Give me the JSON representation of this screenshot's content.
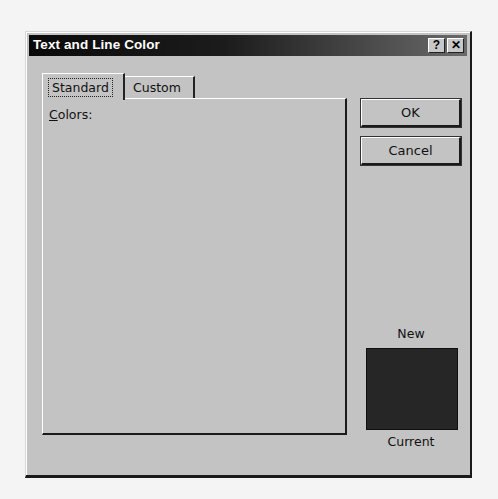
{
  "dialog": {
    "title": "Text and Line Color",
    "help_button": "?",
    "close_button": "✕"
  },
  "tabs": [
    {
      "label": "Standard",
      "active": true
    },
    {
      "label": "Custom",
      "active": false
    }
  ],
  "panel": {
    "colors_label_accel": "C",
    "colors_label_rest": "olors:"
  },
  "buttons": {
    "ok": "OK",
    "cancel": "Cancel"
  },
  "preview": {
    "new_label": "New",
    "current_label": "Current",
    "color": "#262626"
  },
  "hexagon": {
    "selected": {
      "row": 0,
      "col": 0
    },
    "rows": [
      [
        "#2a2a2a",
        "#606060",
        "#6a6a6a",
        "#444444",
        "#3a3a3a",
        "#4a4a4a",
        "#222222"
      ],
      [
        "#505050",
        "#6e6e6e",
        "#7a7a7a",
        "#666666",
        "#4c4c4c",
        "#3e3e3e",
        "#5a5a5a",
        "#383838"
      ],
      [
        "#666666",
        "#7c7c7c",
        "#8c8c8c",
        "#9a9a9a",
        "#7a7a7a",
        "#6a6a6a",
        "#5a5a5a",
        "#4a4a4a",
        "#444444"
      ],
      [
        "#6a6a6a",
        "#848484",
        "#a6a6a6",
        "#b0b0b0",
        "#9c9c9c",
        "#8a8a8a",
        "#7a7a7a",
        "#6c6c6c",
        "#565656",
        "#4e4e4e"
      ],
      [
        "#5c5c5c",
        "#808080",
        "#b8b8b8",
        "#dcdcdc",
        "#d2d2d2",
        "#a8a8a8",
        "#8e8e8e",
        "#808080",
        "#6e6e6e",
        "#585858",
        "#3e3e3e"
      ],
      [
        "#4a4a4a",
        "#7a7a7a",
        "#a6a6a6",
        "#d8d8d8",
        "#e8e8e8",
        "#e0e0e0",
        "#b8b8b8",
        "#9a9a9a",
        "#888888",
        "#747474",
        "#606060",
        "#505050"
      ],
      [
        "#1e1e1e",
        "#6a6a6a",
        "#8c8c8c",
        "#c8c8c8",
        "#e0e0e0",
        "#f0f0f0",
        "#f6f6f6",
        "#c6c6c6",
        "#9e9e9e",
        "#868686",
        "#727272",
        "#5a5a5a",
        "#2a2a2a"
      ],
      [
        "#5a5a5a",
        "#747474",
        "#9e9e9e",
        "#d4d4d4",
        "#eeeeee",
        "#dedede",
        "#b8b8b8",
        "#9a9a9a",
        "#8a8a8a",
        "#7a7a7a",
        "#626262",
        "#3a3a3a"
      ],
      [
        "#2a2a2a",
        "#6c6c6c",
        "#aaaaaa",
        "#e2e2e2",
        "#dadada",
        "#a8a8a8",
        "#8e8e8e",
        "#808080",
        "#6c6c6c",
        "#565656",
        "#404040"
      ],
      [
        "#5a5a5a",
        "#7e7e7e",
        "#b0b0b0",
        "#e4e4e4",
        "#b0b0b0",
        "#8e8e8e",
        "#7c7c7c",
        "#6c6c6c",
        "#4a4a4a",
        "#1e1e1e"
      ],
      [
        "#5e5e5e",
        "#7a7a7a",
        "#929292",
        "#9c9c9c",
        "#888888",
        "#7a7a7a",
        "#6a6a6a",
        "#5c5c5c",
        "#4a4a4a"
      ],
      [
        "#525252",
        "#6e6e6e",
        "#767676",
        "#6a6a6a",
        "#5e5e5e",
        "#565656",
        "#505050",
        "#444444"
      ],
      [
        "#2a2a2a",
        "#505050",
        "#4a4a4a",
        "#383838",
        "#262626",
        "#2e2e2e",
        "#3a3a3a"
      ]
    ],
    "grays": {
      "white": "#ffffff",
      "black": "#000000",
      "top_row": [
        "#f6f6f6",
        "#e6e6e6",
        "#9a9a9a",
        "#7a7a7a",
        "#5e5e5e",
        "#3e3e3e",
        "#141414",
        "#0a0a0a"
      ],
      "bottom_row": [
        "#d2d2d2",
        "#b0b0b0",
        "#888888",
        "#6a6a6a",
        "#4a4a4a",
        "#2a2a2a",
        "#121212"
      ]
    }
  }
}
